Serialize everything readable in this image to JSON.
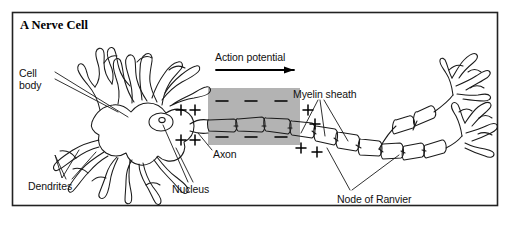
{
  "figure": {
    "title": "A Nerve Cell",
    "kind": "biology-diagram",
    "border_color": "#222222",
    "ink_color": "#1a1a1a",
    "shade_color": "#b3b3b3",
    "background": "#ffffff",
    "width": 510,
    "height": 226
  },
  "labels": {
    "cell_body": "Cell\nbody",
    "dendrites": "Dendrites",
    "nucleus": "Nucleus",
    "axon": "Axon",
    "action_potential": "Action potential",
    "myelin_sheath": "Myelin sheath",
    "node_of_ranvier": "Node of Ranvier"
  },
  "charges": {
    "outside_positive_symbol": "+",
    "inside_negative_symbol": "–",
    "positive_left_of_depolarized": [
      "+",
      "+",
      "+",
      "+"
    ],
    "negative_in_depolarized_top": [
      "–",
      "–",
      "–"
    ],
    "negative_in_depolarized_bottom": [
      "–",
      "–",
      "–"
    ],
    "positive_right_of_depolarized": [
      "+",
      "+",
      "+",
      "+"
    ]
  },
  "annotations": {
    "arrow_direction": "right",
    "arrow_meaning": "direction of action potential propagation",
    "depolarized_region_shaded": true
  }
}
